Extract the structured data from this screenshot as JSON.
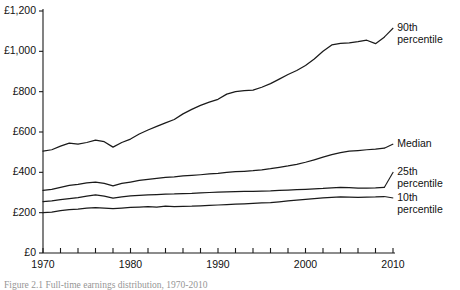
{
  "chart_data": {
    "type": "line",
    "title": "",
    "xlabel": "",
    "ylabel": "",
    "xlim": [
      1970,
      2010
    ],
    "ylim": [
      0,
      1200
    ],
    "grid": false,
    "legend_position": "right-inline",
    "currency_prefix": "£",
    "y_ticks": [
      0,
      200,
      400,
      600,
      800,
      1000,
      1200
    ],
    "y_tick_labels": [
      "£0",
      "£200",
      "£400",
      "£600",
      "£800",
      "£1,000",
      "£1,200"
    ],
    "x_ticks": [
      1970,
      1972,
      1974,
      1976,
      1978,
      1980,
      1982,
      1984,
      1986,
      1988,
      1990,
      1992,
      1994,
      1996,
      1998,
      2000,
      2002,
      2004,
      2006,
      2008,
      2010
    ],
    "x_tick_labels_shown": [
      "1970",
      "1980",
      "1990",
      "2000",
      "2010"
    ],
    "x_labeled_ticks": [
      1970,
      1980,
      1990,
      2000,
      2010
    ],
    "x": [
      1970,
      1971,
      1972,
      1973,
      1974,
      1975,
      1976,
      1977,
      1978,
      1979,
      1980,
      1981,
      1982,
      1983,
      1984,
      1985,
      1986,
      1987,
      1988,
      1989,
      1990,
      1991,
      1992,
      1993,
      1994,
      1995,
      1996,
      1997,
      1998,
      1999,
      2000,
      2001,
      2002,
      2003,
      2004,
      2005,
      2006,
      2007,
      2008,
      2009
    ],
    "series": [
      {
        "name": "90th percentile",
        "label": "90th\npercentile",
        "color": "#1a1a1a",
        "values": [
          505,
          512,
          530,
          545,
          540,
          548,
          560,
          552,
          525,
          548,
          565,
          590,
          610,
          628,
          645,
          662,
          690,
          712,
          732,
          748,
          762,
          788,
          800,
          805,
          808,
          822,
          840,
          862,
          885,
          905,
          930,
          962,
          1000,
          1032,
          1040,
          1042,
          1048,
          1055,
          1038,
          1070
        ]
      },
      {
        "name": "Median",
        "label": "Median",
        "color": "#1a1a1a",
        "values": [
          310,
          315,
          325,
          335,
          340,
          348,
          352,
          345,
          333,
          345,
          352,
          360,
          365,
          370,
          375,
          378,
          382,
          385,
          388,
          392,
          395,
          400,
          403,
          405,
          408,
          412,
          418,
          425,
          432,
          440,
          450,
          462,
          475,
          488,
          498,
          505,
          508,
          512,
          515,
          520
        ]
      },
      {
        "name": "25th percentile",
        "label": "25th\npercentile",
        "color": "#1a1a1a",
        "values": [
          255,
          258,
          265,
          270,
          275,
          282,
          288,
          282,
          272,
          278,
          283,
          286,
          288,
          290,
          292,
          293,
          295,
          296,
          298,
          300,
          302,
          303,
          304,
          305,
          306,
          307,
          308,
          310,
          312,
          314,
          316,
          318,
          320,
          323,
          326,
          324,
          322,
          322,
          323,
          325
        ]
      },
      {
        "name": "10th percentile",
        "label": "10th\npercentile",
        "color": "#1a1a1a",
        "values": [
          200,
          203,
          210,
          215,
          218,
          222,
          225,
          223,
          220,
          223,
          226,
          228,
          230,
          228,
          232,
          230,
          231,
          232,
          234,
          236,
          238,
          240,
          242,
          244,
          246,
          248,
          250,
          254,
          258,
          262,
          266,
          270,
          273,
          276,
          278,
          277,
          276,
          277,
          278,
          280
        ]
      }
    ]
  },
  "axis": {
    "y_labels": [
      "£1,200",
      "£1,000",
      "£800",
      "£600",
      "£400",
      "£200",
      "£0"
    ],
    "x_labels": [
      "1970",
      "1980",
      "1990",
      "2000",
      "2010"
    ]
  },
  "caption": {
    "text": "Figure 2.1  Full-time earnings distribution, 1970-2010"
  }
}
